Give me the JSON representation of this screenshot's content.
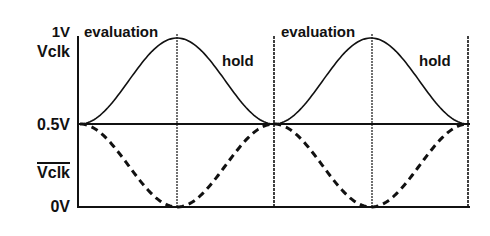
{
  "diagram": {
    "y_labels": {
      "top_voltage": "1V",
      "top_signal": "Vclk",
      "mid_voltage": "0.5V",
      "bottom_signal": "Vclk",
      "bottom_signal_note": "complement (overlined)",
      "bottom_voltage": "0V"
    },
    "phase_labels": [
      {
        "label": "evaluation"
      },
      {
        "label": "hold"
      },
      {
        "label": "evaluation"
      },
      {
        "label": "hold"
      }
    ],
    "signals": [
      {
        "name": "Vclk",
        "style": "solid",
        "shape": "raised cosine, 0.5V to 1V, peaks at evaluation/hold boundary"
      },
      {
        "name": "Vclk_bar",
        "style": "dashed",
        "shape": "raised cosine, 0.5V to 0V, mirror of Vclk"
      }
    ],
    "colors": {
      "line": "#111111",
      "background": "#ffffff"
    }
  }
}
